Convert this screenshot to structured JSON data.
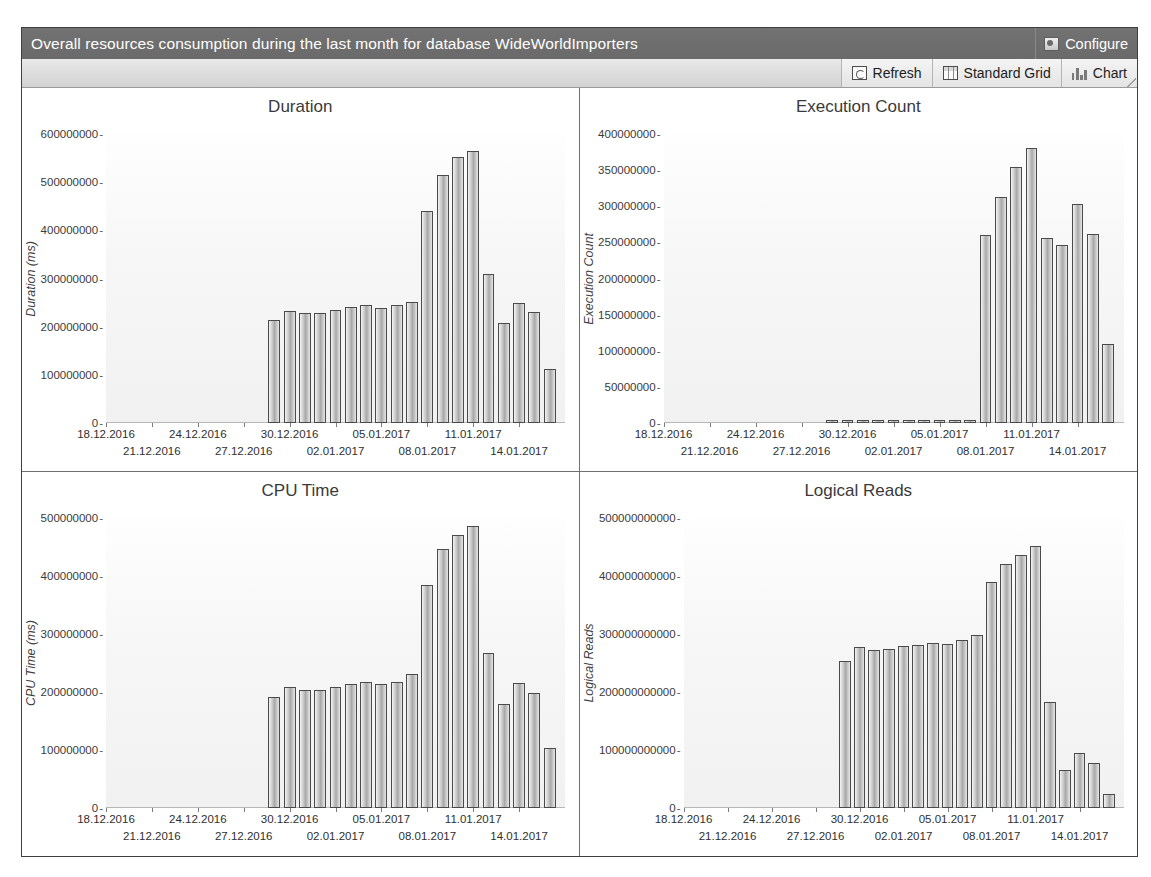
{
  "window": {
    "title": "Overall resources consumption during the last month for database WideWorldImporters"
  },
  "header": {
    "configure_label": "Configure",
    "configure_icon": "configure-icon"
  },
  "toolbar": {
    "buttons": [
      {
        "label": "Refresh",
        "icon": "refresh-icon"
      },
      {
        "label": "Standard Grid",
        "icon": "grid-icon"
      },
      {
        "label": "Chart",
        "icon": "bar-chart-icon"
      }
    ]
  },
  "colors": {
    "titlebar": "#6d6d6d",
    "titlebar_text": "#ffffff",
    "toolbar": "#dcdcdc",
    "frame_border": "#3f3f3f",
    "bar_outline": "#4a4a4a",
    "plot_background": "#f7f7f7",
    "axis_text": "#2f2f2f"
  },
  "chart_data": [
    {
      "type": "bar",
      "title": "Duration",
      "xlabel": "",
      "ylabel": "Duration (ms)",
      "ylim": [
        0,
        600000000
      ],
      "yticks": [
        0,
        100000000,
        200000000,
        300000000,
        400000000,
        500000000,
        600000000
      ],
      "ytick_labels": [
        "0",
        "100000000",
        "200000000",
        "300000000",
        "400000000",
        "500000000",
        "600000000"
      ],
      "grid": false,
      "legend": "none",
      "xlim": [
        "18.12.2016",
        "17.01.2017"
      ],
      "xtick_labels": [
        "18.12.2016",
        "21.12.2016",
        "24.12.2016",
        "27.12.2016",
        "30.12.2016",
        "02.01.2017",
        "05.01.2017",
        "08.01.2017",
        "11.01.2017",
        "14.01.2017"
      ],
      "categories": [
        "29.12.2016",
        "30.12.2016",
        "31.12.2016",
        "01.01.2017",
        "02.01.2017",
        "03.01.2017",
        "04.01.2017",
        "05.01.2017",
        "06.01.2017",
        "07.01.2017",
        "08.01.2017",
        "09.01.2017",
        "10.01.2017",
        "11.01.2017",
        "12.01.2017",
        "13.01.2017",
        "14.01.2017",
        "15.01.2017",
        "16.01.2017"
      ],
      "values": [
        213000000,
        233000000,
        228000000,
        229000000,
        235000000,
        240000000,
        244000000,
        239000000,
        245000000,
        252000000,
        441000000,
        514000000,
        553000000,
        565000000,
        310000000,
        207000000,
        249000000,
        230000000,
        113000000
      ]
    },
    {
      "type": "bar",
      "title": "Execution Count",
      "xlabel": "",
      "ylabel": "Execution Count",
      "ylim": [
        0,
        400000000
      ],
      "yticks": [
        0,
        50000000,
        100000000,
        150000000,
        200000000,
        250000000,
        300000000,
        350000000,
        400000000
      ],
      "ytick_labels": [
        "0",
        "50000000",
        "100000000",
        "150000000",
        "200000000",
        "250000000",
        "300000000",
        "350000000",
        "400000000"
      ],
      "grid": false,
      "legend": "none",
      "xlim": [
        "18.12.2016",
        "17.01.2017"
      ],
      "xtick_labels": [
        "18.12.2016",
        "21.12.2016",
        "24.12.2016",
        "27.12.2016",
        "30.12.2016",
        "02.01.2017",
        "05.01.2017",
        "08.01.2017",
        "11.01.2017",
        "14.01.2017"
      ],
      "categories": [
        "29.12.2016",
        "30.12.2016",
        "31.12.2016",
        "01.01.2017",
        "02.01.2017",
        "03.01.2017",
        "04.01.2017",
        "05.01.2017",
        "06.01.2017",
        "07.01.2017",
        "08.01.2017",
        "09.01.2017",
        "10.01.2017",
        "11.01.2017",
        "12.01.2017",
        "13.01.2017",
        "14.01.2017",
        "15.01.2017",
        "16.01.2017"
      ],
      "values": [
        4000000,
        4000000,
        4000000,
        4000000,
        4000000,
        4000000,
        4000000,
        4000000,
        4000000,
        4000000,
        260000000,
        313000000,
        355000000,
        381000000,
        256000000,
        247000000,
        303000000,
        262000000,
        109000000
      ]
    },
    {
      "type": "bar",
      "title": "CPU Time",
      "xlabel": "",
      "ylabel": "CPU Time (ms)",
      "ylim": [
        0,
        500000000
      ],
      "yticks": [
        0,
        100000000,
        200000000,
        300000000,
        400000000,
        500000000
      ],
      "ytick_labels": [
        "0",
        "100000000",
        "200000000",
        "300000000",
        "400000000",
        "500000000"
      ],
      "grid": false,
      "legend": "none",
      "xlim": [
        "18.12.2016",
        "17.01.2017"
      ],
      "xtick_labels": [
        "18.12.2016",
        "21.12.2016",
        "24.12.2016",
        "27.12.2016",
        "30.12.2016",
        "02.01.2017",
        "05.01.2017",
        "08.01.2017",
        "11.01.2017",
        "14.01.2017"
      ],
      "categories": [
        "29.12.2016",
        "30.12.2016",
        "31.12.2016",
        "01.01.2017",
        "02.01.2017",
        "03.01.2017",
        "04.01.2017",
        "05.01.2017",
        "06.01.2017",
        "07.01.2017",
        "08.01.2017",
        "09.01.2017",
        "10.01.2017",
        "11.01.2017",
        "12.01.2017",
        "13.01.2017",
        "14.01.2017",
        "15.01.2017",
        "16.01.2017"
      ],
      "values": [
        192000000,
        209000000,
        203000000,
        203000000,
        208000000,
        214000000,
        218000000,
        213000000,
        217000000,
        231000000,
        385000000,
        446000000,
        471000000,
        487000000,
        267000000,
        180000000,
        215000000,
        199000000,
        103000000
      ]
    },
    {
      "type": "bar",
      "title": "Logical Reads",
      "xlabel": "",
      "ylabel": "Logical Reads",
      "ylim": [
        0,
        500000000000
      ],
      "yticks": [
        0,
        100000000000,
        200000000000,
        300000000000,
        400000000000,
        500000000000
      ],
      "ytick_labels": [
        "0",
        "100000000000",
        "200000000000",
        "300000000000",
        "400000000000",
        "500000000000"
      ],
      "grid": false,
      "legend": "none",
      "xlim": [
        "18.12.2016",
        "17.01.2017"
      ],
      "xtick_labels": [
        "18.12.2016",
        "21.12.2016",
        "24.12.2016",
        "27.12.2016",
        "30.12.2016",
        "02.01.2017",
        "05.01.2017",
        "08.01.2017",
        "11.01.2017",
        "14.01.2017"
      ],
      "categories": [
        "29.12.2016",
        "30.12.2016",
        "31.12.2016",
        "01.01.2017",
        "02.01.2017",
        "03.01.2017",
        "04.01.2017",
        "05.01.2017",
        "06.01.2017",
        "07.01.2017",
        "08.01.2017",
        "09.01.2017",
        "10.01.2017",
        "11.01.2017",
        "12.01.2017",
        "13.01.2017",
        "14.01.2017",
        "15.01.2017",
        "16.01.2017"
      ],
      "values": [
        254000000000,
        277000000000,
        272000000000,
        274000000000,
        279000000000,
        281000000000,
        285000000000,
        283000000000,
        289000000000,
        299000000000,
        390000000000,
        421000000000,
        437000000000,
        452000000000,
        182000000000,
        65000000000,
        95000000000,
        78000000000,
        24000000000
      ]
    }
  ]
}
